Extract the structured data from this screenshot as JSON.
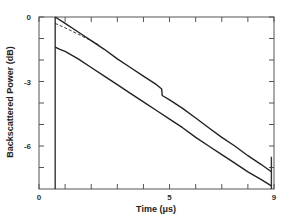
{
  "chart_data": {
    "type": "line",
    "title": "",
    "xlabel": "Time   (μs)",
    "ylabel": "Backscattered   Power   (dB)",
    "xlim": [
      0,
      9
    ],
    "ylim": [
      -8,
      0
    ],
    "x_ticks": [
      0,
      1,
      2,
      3,
      4,
      5,
      6,
      7,
      8,
      9
    ],
    "x_tick_labels": [
      {
        "value": 0,
        "label": "0"
      },
      {
        "value": 5,
        "label": "5"
      },
      {
        "value": 9,
        "label": "9"
      }
    ],
    "y_ticks": [
      0,
      -1,
      -2,
      -3,
      -4,
      -5,
      -6,
      -7
    ],
    "y_tick_labels": [
      {
        "value": 0,
        "label": "0"
      },
      {
        "value": -3,
        "label": "-3"
      },
      {
        "value": -6,
        "label": "-6"
      }
    ],
    "grid": false,
    "legend": null,
    "markers": [
      {
        "type": "vertical-line",
        "x": 0.62,
        "y_from": -8,
        "y_to": 0
      },
      {
        "type": "vertical-line",
        "x": 8.9,
        "y_from": -8,
        "y_to": -6.5
      }
    ],
    "series": [
      {
        "name": "upper trace",
        "style": "solid",
        "x": [
          0.62,
          1.0,
          1.5,
          2.0,
          2.5,
          3.0,
          3.5,
          4.0,
          4.5,
          4.7,
          4.72,
          5.0,
          5.5,
          6.0,
          6.5,
          7.0,
          7.5,
          8.0,
          8.5,
          8.9
        ],
        "y": [
          0.0,
          -0.3,
          -0.7,
          -1.1,
          -1.5,
          -1.95,
          -2.35,
          -2.75,
          -3.15,
          -3.35,
          -3.65,
          -3.85,
          -4.25,
          -4.7,
          -5.15,
          -5.6,
          -6.0,
          -6.45,
          -6.85,
          -7.2
        ]
      },
      {
        "name": "reference (dashed)",
        "style": "dashed",
        "x": [
          0.62,
          1.0,
          1.5,
          2.0,
          2.3
        ],
        "y": [
          -0.3,
          -0.5,
          -0.8,
          -1.1,
          -1.3
        ]
      },
      {
        "name": "lower trace",
        "style": "solid",
        "x": [
          0.62,
          0.8,
          1.0,
          1.5,
          2.0,
          2.5,
          3.0,
          3.5,
          4.0,
          4.5,
          5.0,
          5.5,
          6.0,
          6.5,
          7.0,
          7.5,
          8.0,
          8.5,
          8.9
        ],
        "y": [
          -1.4,
          -1.5,
          -1.6,
          -1.95,
          -2.35,
          -2.75,
          -3.15,
          -3.55,
          -3.95,
          -4.35,
          -4.75,
          -5.15,
          -5.6,
          -6.0,
          -6.4,
          -6.8,
          -7.2,
          -7.55,
          -7.85
        ]
      }
    ]
  }
}
